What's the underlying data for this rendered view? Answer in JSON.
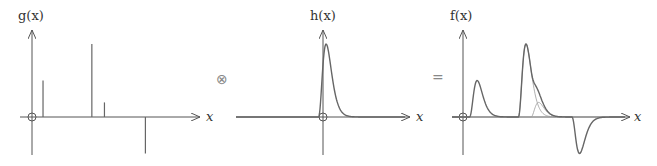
{
  "panels": {
    "g": {
      "label": "g(x)",
      "xlabel": "x",
      "spikes": [
        {
          "x": 0.35,
          "y": 0.5
        },
        {
          "x": 1.9,
          "y": 1.0
        },
        {
          "x": 2.3,
          "y": 0.2
        },
        {
          "x": 3.6,
          "y": -0.5
        }
      ]
    },
    "h": {
      "label": "h(x)",
      "xlabel": "x",
      "shape": "fast rise, exponential decay pulse"
    },
    "f": {
      "label": "f(x)",
      "xlabel": "x",
      "description": "sum of shifted, scaled copies of h(x)"
    }
  },
  "operators": {
    "convolve": "⊗",
    "equals": "="
  }
}
